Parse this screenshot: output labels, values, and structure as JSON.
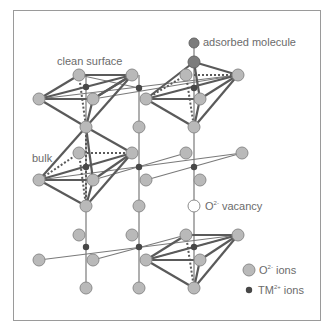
{
  "labels": {
    "clean_surface": "clean surface",
    "adsorbed_molecule": "adsorbed molecule",
    "bulk": "bulk",
    "vacancy_prefix": "O",
    "vacancy_sup": "2-",
    "vacancy_suffix": " vacancy"
  },
  "legend": {
    "o_ions_prefix": "O",
    "o_ions_sup": "2-",
    "o_ions_suffix": " ions",
    "tm_ions_prefix": "TM",
    "tm_ions_sup": "2+",
    "tm_ions_suffix": " ions"
  },
  "colors": {
    "o_ion_fill": "#b8b8b8",
    "o_ion_stroke": "#8e8e8e",
    "tm_ion": "#4a4a4a",
    "bond": "#6f6f6f",
    "octahedron_edge": "#5f5f5f",
    "adsorbed": "#777777",
    "frame": "#9a9a9a",
    "text": "#6b6b6b"
  }
}
